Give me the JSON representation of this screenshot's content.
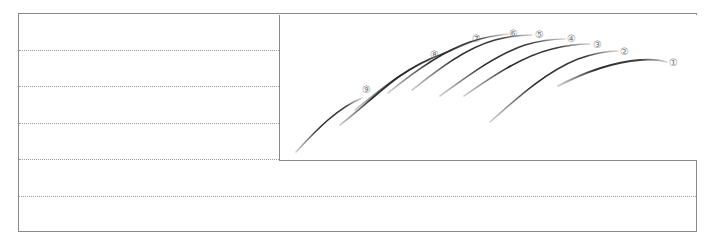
{
  "diagram": {
    "guide_lines_count": 5,
    "strokes": [
      {
        "label": "①",
        "order": 1
      },
      {
        "label": "②",
        "order": 2
      },
      {
        "label": "③",
        "order": 3
      },
      {
        "label": "④",
        "order": 4
      },
      {
        "label": "⑤",
        "order": 5
      },
      {
        "label": "⑥",
        "order": 6
      },
      {
        "label": "⑦",
        "order": 7
      },
      {
        "label": "⑧",
        "order": 8
      },
      {
        "label": "⑨",
        "order": 9
      }
    ],
    "colors": {
      "stroke": "#3a3a3a",
      "frame": "#8a8a8a",
      "guide": "#9a9a9a",
      "label": "#7a7a7a"
    }
  }
}
